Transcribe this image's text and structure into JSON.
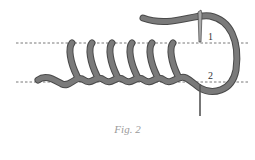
{
  "diagram": {
    "caption": "Fig. 2",
    "points": [
      {
        "label": "1",
        "x": 210,
        "y": 40
      },
      {
        "label": "2",
        "x": 210,
        "y": 80
      }
    ],
    "guide_lines": [
      {
        "name": "upper",
        "y": 43
      },
      {
        "name": "lower",
        "y": 82
      }
    ],
    "stitch_count": 6,
    "colors": {
      "thread": "#7a7a7a",
      "thread_outline": "#4a4a4a",
      "guide": "#555555",
      "needle": "#888888",
      "caption": "#9a9a9a"
    }
  }
}
